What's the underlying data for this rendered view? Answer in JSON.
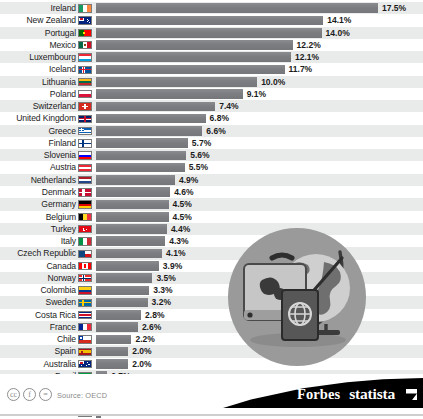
{
  "chart_data": {
    "type": "bar",
    "title": "",
    "subtitle": "",
    "xlabel": "",
    "ylabel": "",
    "orientation": "horizontal",
    "value_suffix": "%",
    "xlim": [
      0,
      17.5
    ],
    "grid": false,
    "legend": null,
    "categories": [
      "Ireland",
      "New Zealand",
      "Portugal",
      "Mexico",
      "Luxembourg",
      "Iceland",
      "Lithuania",
      "Poland",
      "Switzerland",
      "United Kingdom",
      "Greece",
      "Finland",
      "Slovenia",
      "Austria",
      "Netherlands",
      "Denmark",
      "Germany",
      "Belgium",
      "Turkey",
      "Italy",
      "Czech Republic",
      "Canada",
      "Norway",
      "Colombia",
      "Sweden",
      "Costa Rica",
      "France",
      "Chile",
      "Spain",
      "Australia",
      "Brazil",
      "Japan",
      "United States",
      "China"
    ],
    "values": [
      17.5,
      14.1,
      14.0,
      12.2,
      12.1,
      11.7,
      10.0,
      9.1,
      7.4,
      6.8,
      6.6,
      5.7,
      5.6,
      5.5,
      4.9,
      4.6,
      4.5,
      4.5,
      4.4,
      4.3,
      4.1,
      3.9,
      3.5,
      3.3,
      3.2,
      2.8,
      2.6,
      2.2,
      2.0,
      2.0,
      0.7,
      0.6,
      0.5,
      0.3
    ],
    "value_labels": [
      "17.5%",
      "14.1%",
      "14.0%",
      "12.2%",
      "12.1%",
      "11.7%",
      "10.0%",
      "9.1%",
      "7.4%",
      "6.8%",
      "6.6%",
      "5.7%",
      "5.6%",
      "5.5%",
      "4.9%",
      "4.6%",
      "4.5%",
      "4.5%",
      "4.4%",
      "4.3%",
      "4.1%",
      "3.9%",
      "3.5%",
      "3.3%",
      "3.2%",
      "2.8%",
      "2.6%",
      "2.2%",
      "2.0%",
      "2.0%",
      "0.7%",
      "0.6%",
      "0.5%",
      "0.3%"
    ],
    "bar_color": "#7f8184",
    "row_alt_color": "#e9eaea"
  },
  "rows": [
    {
      "country": "Ireland",
      "value": 17.5,
      "label": "17.5%",
      "flag": "flag-ireland"
    },
    {
      "country": "New Zealand",
      "value": 14.1,
      "label": "14.1%",
      "flag": "flag-new-zealand"
    },
    {
      "country": "Portugal",
      "value": 14.0,
      "label": "14.0%",
      "flag": "flag-portugal"
    },
    {
      "country": "Mexico",
      "value": 12.2,
      "label": "12.2%",
      "flag": "flag-mexico"
    },
    {
      "country": "Luxembourg",
      "value": 12.1,
      "label": "12.1%",
      "flag": "flag-luxembourg"
    },
    {
      "country": "Iceland",
      "value": 11.7,
      "label": "11.7%",
      "flag": "flag-iceland"
    },
    {
      "country": "Lithuania",
      "value": 10.0,
      "label": "10.0%",
      "flag": "flag-lithuania"
    },
    {
      "country": "Poland",
      "value": 9.1,
      "label": "9.1%",
      "flag": "flag-poland"
    },
    {
      "country": "Switzerland",
      "value": 7.4,
      "label": "7.4%",
      "flag": "flag-switzerland"
    },
    {
      "country": "United Kingdom",
      "value": 6.8,
      "label": "6.8%",
      "flag": "flag-united-kingdom"
    },
    {
      "country": "Greece",
      "value": 6.6,
      "label": "6.6%",
      "flag": "flag-greece"
    },
    {
      "country": "Finland",
      "value": 5.7,
      "label": "5.7%",
      "flag": "flag-finland"
    },
    {
      "country": "Slovenia",
      "value": 5.6,
      "label": "5.6%",
      "flag": "flag-slovenia"
    },
    {
      "country": "Austria",
      "value": 5.5,
      "label": "5.5%",
      "flag": "flag-austria"
    },
    {
      "country": "Netherlands",
      "value": 4.9,
      "label": "4.9%",
      "flag": "flag-netherlands"
    },
    {
      "country": "Denmark",
      "value": 4.6,
      "label": "4.6%",
      "flag": "flag-denmark"
    },
    {
      "country": "Germany",
      "value": 4.5,
      "label": "4.5%",
      "flag": "flag-germany"
    },
    {
      "country": "Belgium",
      "value": 4.5,
      "label": "4.5%",
      "flag": "flag-belgium"
    },
    {
      "country": "Turkey",
      "value": 4.4,
      "label": "4.4%",
      "flag": "flag-turkey"
    },
    {
      "country": "Italy",
      "value": 4.3,
      "label": "4.3%",
      "flag": "flag-italy"
    },
    {
      "country": "Czech Republic",
      "value": 4.1,
      "label": "4.1%",
      "flag": "flag-czech-republic"
    },
    {
      "country": "Canada",
      "value": 3.9,
      "label": "3.9%",
      "flag": "flag-canada"
    },
    {
      "country": "Norway",
      "value": 3.5,
      "label": "3.5%",
      "flag": "flag-norway"
    },
    {
      "country": "Colombia",
      "value": 3.3,
      "label": "3.3%",
      "flag": "flag-colombia"
    },
    {
      "country": "Sweden",
      "value": 3.2,
      "label": "3.2%",
      "flag": "flag-sweden"
    },
    {
      "country": "Costa Rica",
      "value": 2.8,
      "label": "2.8%",
      "flag": "flag-costa-rica"
    },
    {
      "country": "France",
      "value": 2.6,
      "label": "2.6%",
      "flag": "flag-france"
    },
    {
      "country": "Chile",
      "value": 2.2,
      "label": "2.2%",
      "flag": "flag-chile"
    },
    {
      "country": "Spain",
      "value": 2.0,
      "label": "2.0%",
      "flag": "flag-spain"
    },
    {
      "country": "Australia",
      "value": 2.0,
      "label": "2.0%",
      "flag": "flag-australia"
    },
    {
      "country": "Brazil",
      "value": 0.7,
      "label": "0.7%",
      "flag": "flag-brazil"
    },
    {
      "country": "Japan",
      "value": 0.6,
      "label": "0.6%",
      "flag": "flag-japan"
    },
    {
      "country": "United States",
      "value": 0.5,
      "label": "0.5%",
      "flag": "flag-united-states"
    },
    {
      "country": "China",
      "value": 0.3,
      "label": "0.3%",
      "flag": "flag-china"
    }
  ],
  "illustration": {
    "name": "travel-globe-suitcase-passport",
    "circle_color": "#9a9a9a"
  },
  "footer": {
    "cc_icons": [
      "cc",
      "f",
      "="
    ],
    "source": "Source: OECD",
    "brand_forbes": "Forbes",
    "brand_statista": "statista"
  }
}
